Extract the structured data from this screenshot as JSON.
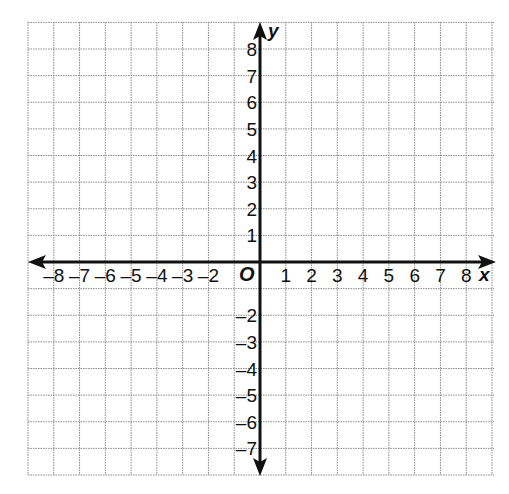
{
  "chart_data": {
    "type": "coordinate-plane",
    "title": "",
    "xlabel": "x",
    "ylabel": "y",
    "origin_label": "O",
    "xlim": [
      -9,
      9
    ],
    "ylim": [
      -8,
      9
    ],
    "grid": true,
    "grid_style": "dotted",
    "x_tick_labels": [
      "-8",
      "-7",
      "-6",
      "-5",
      "-4",
      "-3",
      "-2",
      "1",
      "2",
      "3",
      "4",
      "5",
      "6",
      "7",
      "8"
    ],
    "x_ticks": [
      -8,
      -7,
      -6,
      -5,
      -4,
      -3,
      -2,
      1,
      2,
      3,
      4,
      5,
      6,
      7,
      8
    ],
    "y_tick_labels": [
      "8",
      "7",
      "6",
      "5",
      "4",
      "3",
      "2",
      "1",
      "-2",
      "-3",
      "-4",
      "-5",
      "-6",
      "-7"
    ],
    "y_ticks": [
      8,
      7,
      6,
      5,
      4,
      3,
      2,
      1,
      -2,
      -3,
      -4,
      -5,
      -6,
      -7
    ],
    "series": []
  },
  "axes": {
    "x_label": "x",
    "y_label": "y",
    "origin": "O"
  },
  "colors": {
    "grid": "#8a8a8a",
    "axis": "#111111",
    "background": "#ffffff"
  }
}
